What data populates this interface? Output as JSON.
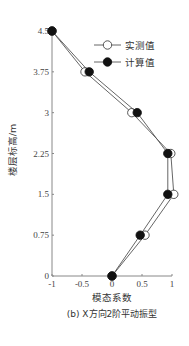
{
  "chart_data": {
    "type": "line",
    "title": "",
    "caption": "(b) X方向2阶平动振型",
    "xlabel": "模态系数",
    "ylabel": "楼层标高/m",
    "xlim": [
      -1,
      1
    ],
    "ylim": [
      0,
      4.5
    ],
    "xticks": [
      -1,
      -0.5,
      0,
      0.5,
      1
    ],
    "xtick_labels": [
      "-1",
      "-0.5",
      "0",
      "0.5",
      "1"
    ],
    "yticks": [
      0,
      0.75,
      1.5,
      2.25,
      3,
      3.75,
      4.5
    ],
    "ytick_labels": [
      "0",
      "0.75",
      "1.5",
      "2.25",
      "3",
      "3.75",
      "4.5"
    ],
    "grid": false,
    "legend_position": "upper right",
    "series": [
      {
        "name": "实测值",
        "marker": "hollow-circle",
        "color": "#333333",
        "points": [
          {
            "x": 0,
            "y": 0
          },
          {
            "x": 0.55,
            "y": 0.75
          },
          {
            "x": 1.03,
            "y": 1.5
          },
          {
            "x": 0.98,
            "y": 2.25
          },
          {
            "x": 0.33,
            "y": 3
          },
          {
            "x": -0.45,
            "y": 3.75
          },
          {
            "x": -1.0,
            "y": 4.5
          }
        ]
      },
      {
        "name": "计算值",
        "marker": "filled-circle",
        "color": "#111111",
        "points": [
          {
            "x": 0,
            "y": 0
          },
          {
            "x": 0.47,
            "y": 0.75
          },
          {
            "x": 0.93,
            "y": 1.5
          },
          {
            "x": 0.93,
            "y": 2.25
          },
          {
            "x": 0.42,
            "y": 3
          },
          {
            "x": -0.38,
            "y": 3.75
          },
          {
            "x": -1.0,
            "y": 4.5
          }
        ]
      }
    ]
  }
}
